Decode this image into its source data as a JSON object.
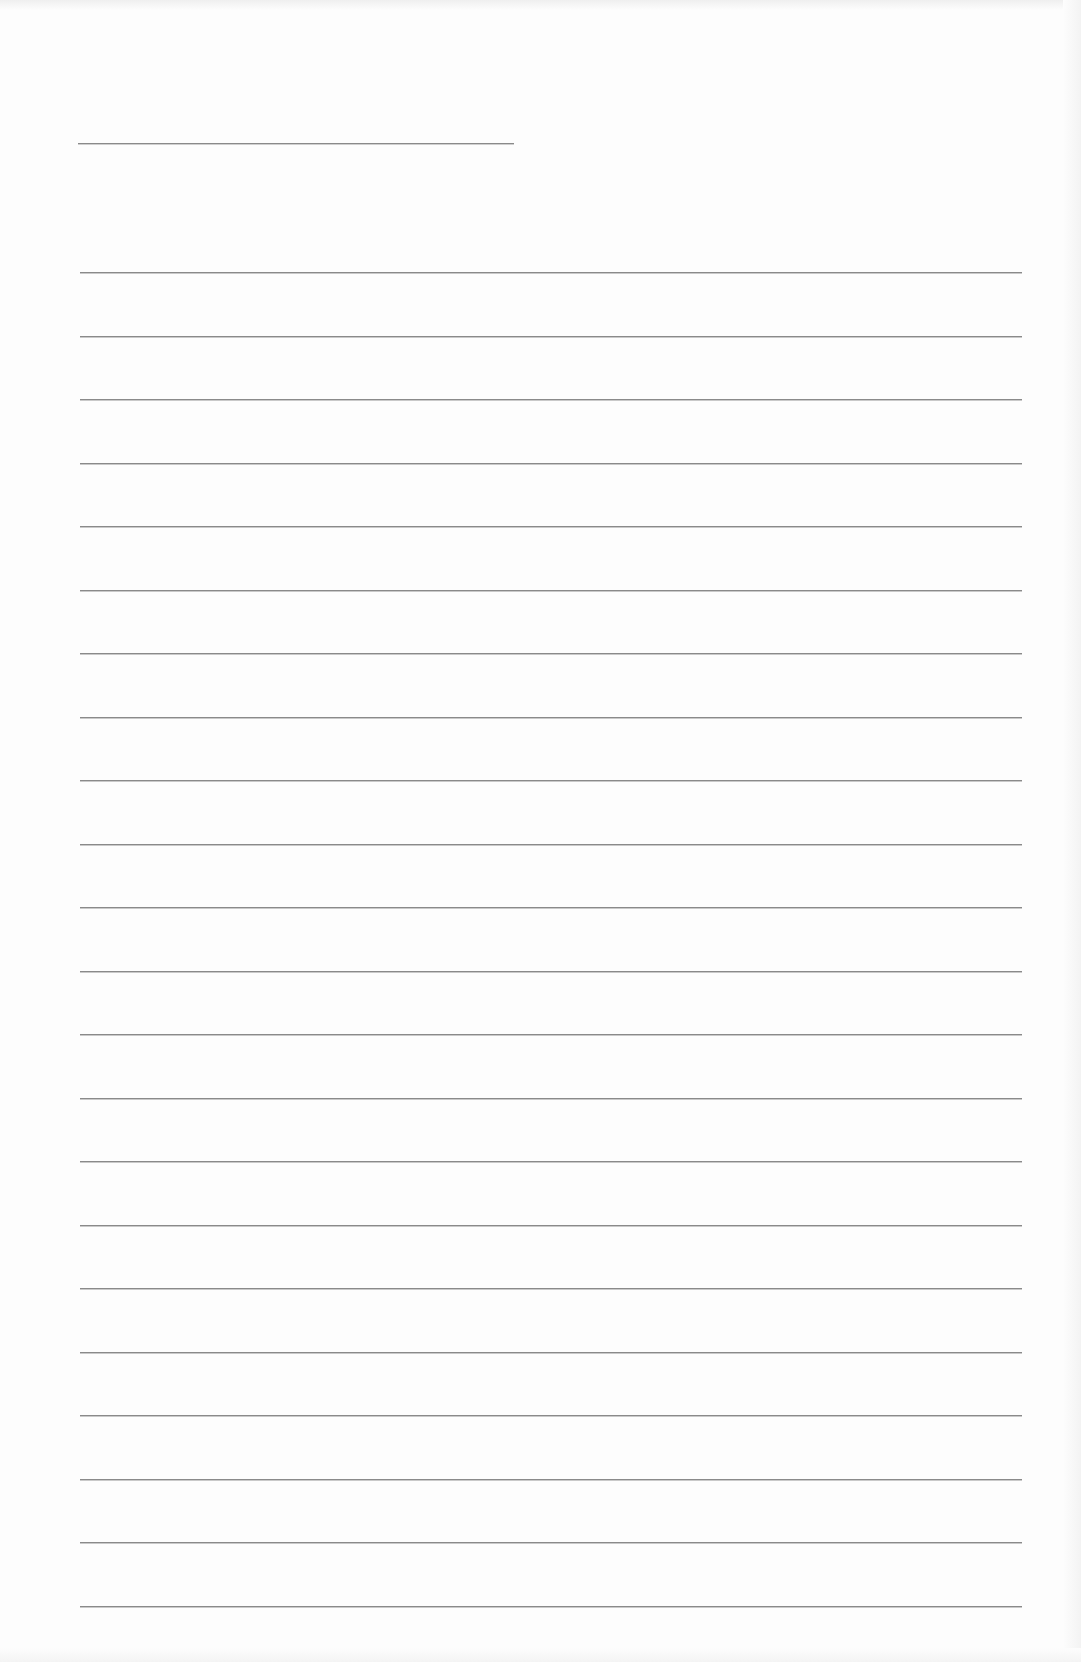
{
  "page": {
    "type": "blank lined writing paper",
    "background_color": "#fdfdfd",
    "line_color": "#8a8a8a",
    "title_line": {
      "x_start": 78,
      "x_end": 514,
      "y": 143
    },
    "writing_lines": {
      "count": 22,
      "x_start": 80,
      "x_end": 1022,
      "first_y": 272,
      "spacing": 63.5
    }
  }
}
